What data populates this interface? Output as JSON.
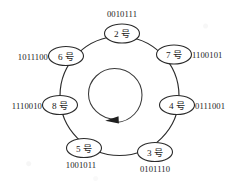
{
  "figure": {
    "type": "ring-topology-diagram",
    "rotation_direction": "counter-clockwise",
    "node_suffix": "号",
    "nodes": [
      {
        "id": "n2",
        "number": "2",
        "label": "2 号",
        "code": "0010111",
        "position": "top",
        "code_side": "above"
      },
      {
        "id": "n7",
        "number": "7",
        "label": "7 号",
        "code": "1100101",
        "position": "upper-right",
        "code_side": "right"
      },
      {
        "id": "n4",
        "number": "4",
        "label": "4 号",
        "code": "0111001",
        "position": "right",
        "code_side": "right"
      },
      {
        "id": "n3",
        "number": "3",
        "label": "3 号",
        "code": "0101110",
        "position": "lower-right",
        "code_side": "below"
      },
      {
        "id": "n5",
        "number": "5",
        "label": "5 号",
        "code": "1001011",
        "position": "lower-left",
        "code_side": "below"
      },
      {
        "id": "n8",
        "number": "8",
        "label": "8 号",
        "code": "1110010",
        "position": "left",
        "code_side": "left"
      },
      {
        "id": "n6",
        "number": "6",
        "label": "6 号",
        "code": "1011100",
        "position": "upper-left",
        "code_side": "left"
      }
    ],
    "colors": {
      "ink": "#2b2b2b",
      "text": "#1a1a1a",
      "background": "#ffffff"
    }
  }
}
